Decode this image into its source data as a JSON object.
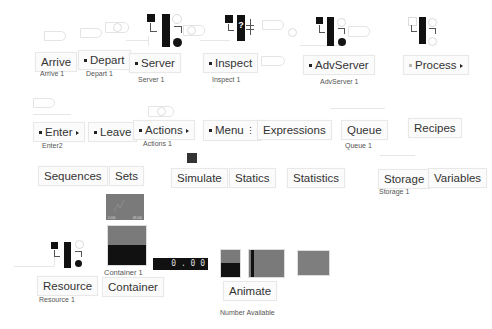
{
  "palette": {
    "row1": [
      {
        "id": "arrive",
        "label": "Arrive",
        "caption": "Arrive 1",
        "has_dot": false,
        "has_arrow": false
      },
      {
        "id": "depart",
        "label": "Depart",
        "caption": "Depart 1",
        "has_dot": true,
        "has_arrow": false
      },
      {
        "id": "server",
        "label": "Server",
        "caption": "Server 1",
        "has_dot": true,
        "has_arrow": false
      },
      {
        "id": "inspect",
        "label": "Inspect",
        "caption": "Inspect 1",
        "has_dot": true,
        "has_arrow": false
      },
      {
        "id": "advserver",
        "label": "AdvServer",
        "caption": "AdvServer 1",
        "has_dot": true,
        "has_arrow": false
      },
      {
        "id": "process",
        "label": "Process",
        "caption": "",
        "has_dot": true,
        "has_arrow": true
      }
    ],
    "row2": [
      {
        "id": "enter",
        "label": "Enter",
        "caption": "Enter2",
        "has_dot": true,
        "has_arrow": true
      },
      {
        "id": "leave",
        "label": "Leave",
        "caption": "",
        "has_dot": true,
        "has_arrow": false
      },
      {
        "id": "actions",
        "label": "Actions",
        "caption": "Actions 1",
        "has_dot": true,
        "has_arrow": true
      },
      {
        "id": "menu",
        "label": "Menu",
        "caption": "",
        "has_dot": true,
        "has_arrow": false
      },
      {
        "id": "expressions",
        "label": "Expressions",
        "caption": ""
      },
      {
        "id": "queue",
        "label": "Queue",
        "caption": "Queue 1"
      },
      {
        "id": "recipes",
        "label": "Recipes",
        "caption": ""
      }
    ],
    "row3": [
      {
        "id": "sequences",
        "label": "Sequences",
        "caption": ""
      },
      {
        "id": "sets",
        "label": "Sets",
        "caption": ""
      },
      {
        "id": "simulate",
        "label": "Simulate",
        "caption": ""
      },
      {
        "id": "statics",
        "label": "Statics",
        "caption": ""
      },
      {
        "id": "statistics",
        "label": "Statistics",
        "caption": ""
      },
      {
        "id": "storage",
        "label": "Storage",
        "caption": "Storage 1"
      },
      {
        "id": "variables",
        "label": "Variables",
        "caption": ""
      }
    ],
    "row4": [
      {
        "id": "resource",
        "label": "Resource",
        "caption": "Resource 1"
      },
      {
        "id": "container",
        "label": "Container",
        "caption": "Container 1"
      },
      {
        "id": "animate",
        "label": "Animate",
        "caption": "Number Available"
      }
    ]
  },
  "displays": {
    "number_display_value": "0 . 0 0",
    "plot_axis_left": "0.000",
    "plot_axis_right": "48.000"
  },
  "colors": {
    "icon_dark": "#111111",
    "plot_gray": "#7a7a7a",
    "label_bg": "#fbfbfb",
    "label_border": "#e8e8e8"
  }
}
